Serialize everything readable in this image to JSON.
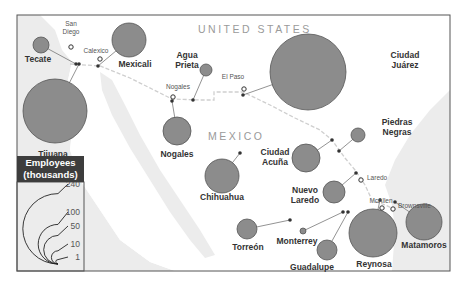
{
  "map": {
    "countries": [
      {
        "name": "UNITED STATES",
        "x": 198,
        "y": 33
      },
      {
        "name": "MEXICO",
        "x": 208,
        "y": 140
      }
    ],
    "colors": {
      "bubble_fill": "#8c8c8c",
      "bubble_stroke": "#555555",
      "land_mexico": "#ffffff",
      "sea": "#ececec",
      "frame": "#555555",
      "legend_header_bg": "#3d3d3d",
      "border_dash": "#cfcfcf"
    },
    "us_cities": [
      {
        "name": "San Diego",
        "lines": [
          "San",
          "Diego"
        ],
        "x": 71,
        "y": 45
      },
      {
        "name": "Calexico",
        "lines": [
          "Calexico"
        ],
        "x": 100,
        "y": 59
      },
      {
        "name": "Nogales",
        "lines": [
          "Nogales"
        ],
        "x": 173,
        "y": 95
      },
      {
        "name": "El Paso",
        "lines": [
          "El Paso"
        ],
        "x": 244,
        "y": 87
      },
      {
        "name": "Laredo",
        "lines": [
          "Laredo"
        ],
        "x": 361,
        "y": 182
      },
      {
        "name": "McAllen",
        "lines": [
          "McAllen"
        ],
        "x": 381,
        "y": 211
      },
      {
        "name": "Brownsville",
        "lines": [
          "Brownsville"
        ],
        "x": 395,
        "y": 212
      }
    ],
    "mexican_cities": [
      {
        "name": "Tecate",
        "cx": 41,
        "cy": 45,
        "r": 8,
        "anchor": [
          76,
          64
        ],
        "label_x": 38,
        "label_y": 62,
        "label_anchor": "middle",
        "lines": [
          "Tecate"
        ]
      },
      {
        "name": "Mexicali",
        "cx": 129,
        "cy": 40,
        "r": 17,
        "anchor": [
          98,
          66
        ],
        "label_x": 135,
        "label_y": 67,
        "label_anchor": "middle",
        "lines": [
          "Mexicali"
        ]
      },
      {
        "name": "Tijuana",
        "cx": 55,
        "cy": 111,
        "r": 32,
        "anchor": [
          79,
          64
        ],
        "label_x": 53,
        "label_y": 157,
        "label_anchor": "middle",
        "lines": [
          "Tijuana"
        ]
      },
      {
        "name": "Agua Prieta",
        "cx": 206,
        "cy": 70,
        "r": 6,
        "anchor": [
          193,
          100
        ],
        "label_x": 187,
        "label_y": 58,
        "label_anchor": "middle",
        "lines": [
          "Agua",
          "Prieta"
        ]
      },
      {
        "name": "Nogales",
        "cx": 177,
        "cy": 131,
        "r": 14,
        "anchor": [
          172,
          101
        ],
        "label_x": 177,
        "label_y": 157,
        "label_anchor": "middle",
        "lines": [
          "Nogales"
        ]
      },
      {
        "name": "Ciudad Juárez",
        "cx": 308,
        "cy": 72,
        "r": 38,
        "anchor": [
          243,
          95
        ],
        "label_x": 405,
        "label_y": 58,
        "label_anchor": "middle",
        "lines": [
          "Ciudad",
          "Juárez"
        ]
      },
      {
        "name": "Chihuahua",
        "cx": 222,
        "cy": 176,
        "r": 17,
        "anchor": [
          240,
          153
        ],
        "label_x": 222,
        "label_y": 200,
        "label_anchor": "middle",
        "lines": [
          "Chihuahua"
        ]
      },
      {
        "name": "Ciudad Acuña",
        "cx": 306,
        "cy": 158,
        "r": 14,
        "anchor": [
          332,
          140
        ],
        "label_x": 275,
        "label_y": 155,
        "label_anchor": "middle",
        "lines": [
          "Ciudad",
          "Acuña"
        ]
      },
      {
        "name": "Piedras Negras",
        "cx": 358,
        "cy": 135,
        "r": 7,
        "anchor": [
          339,
          151
        ],
        "label_x": 397,
        "label_y": 125,
        "label_anchor": "middle",
        "lines": [
          "Piedras",
          "Negras"
        ]
      },
      {
        "name": "Nuevo Laredo",
        "cx": 334,
        "cy": 192,
        "r": 11,
        "anchor": [
          356,
          173
        ],
        "label_x": 305,
        "label_y": 193,
        "label_anchor": "middle",
        "lines": [
          "Nuevo",
          "Laredo"
        ]
      },
      {
        "name": "Torreón",
        "cx": 247,
        "cy": 229,
        "r": 10,
        "anchor": [
          290,
          220
        ],
        "label_x": 248,
        "label_y": 250,
        "label_anchor": "middle",
        "lines": [
          "Torreón"
        ]
      },
      {
        "name": "Monterrey",
        "cx": 303,
        "cy": 231,
        "r": 3,
        "anchor": [
          343,
          212
        ],
        "label_x": 297,
        "label_y": 244,
        "label_anchor": "middle",
        "lines": [
          "Monterrey"
        ]
      },
      {
        "name": "Guadalupe",
        "cx": 327,
        "cy": 250,
        "r": 10,
        "anchor": [
          348,
          212
        ],
        "label_x": 312,
        "label_y": 270,
        "label_anchor": "middle",
        "lines": [
          "Guadalupe"
        ]
      },
      {
        "name": "Reynosa",
        "cx": 373,
        "cy": 233,
        "r": 24,
        "anchor": [
          380,
          200
        ],
        "label_x": 374,
        "label_y": 267,
        "label_anchor": "middle",
        "lines": [
          "Reynosa"
        ]
      },
      {
        "name": "Matamoros",
        "cx": 424,
        "cy": 222,
        "r": 18,
        "anchor": [
          395,
          202
        ],
        "label_x": 424,
        "label_y": 248,
        "label_anchor": "middle",
        "lines": [
          "Matamoros"
        ]
      }
    ],
    "legend": {
      "title_line1": "Employees",
      "title_line2": "(thousands)",
      "values": [
        {
          "label": "240",
          "r": 32,
          "y": 187
        },
        {
          "label": "100",
          "r": 18,
          "y": 215
        },
        {
          "label": "50",
          "r": 13,
          "y": 229
        },
        {
          "label": "10",
          "r": 6,
          "y": 247
        },
        {
          "label": "1",
          "r": 2,
          "y": 260
        }
      ]
    }
  }
}
